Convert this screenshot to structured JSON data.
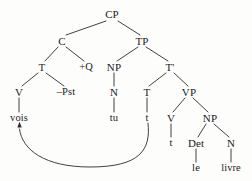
{
  "diagram": {
    "type": "constituency-tree",
    "language_example": "vois tu le livre",
    "canvas": {
      "width": 252,
      "height": 181,
      "background": "#fdfdfc"
    },
    "line_color": "#2b2b2b",
    "text_color": "#1a1a1a"
  },
  "nodes": {
    "cp": {
      "label": "CP",
      "x": 112,
      "y": 14,
      "kind": "category"
    },
    "c": {
      "label": "C",
      "x": 62,
      "y": 41,
      "kind": "category"
    },
    "tp": {
      "label": "TP",
      "x": 142,
      "y": 41,
      "kind": "category"
    },
    "t_in_c": {
      "label": "T",
      "x": 42,
      "y": 67,
      "kind": "category"
    },
    "q_feature": {
      "label": "+Q",
      "x": 86,
      "y": 67,
      "kind": "feature"
    },
    "np_subj": {
      "label": "NP",
      "x": 114,
      "y": 67,
      "kind": "category"
    },
    "tbar": {
      "label": "T'",
      "x": 170,
      "y": 67,
      "kind": "category"
    },
    "v_in_t": {
      "label": "V",
      "x": 19,
      "y": 92,
      "kind": "category"
    },
    "pst": {
      "label": "–Pst",
      "x": 66,
      "y": 92,
      "kind": "feature"
    },
    "n_subj": {
      "label": "N",
      "x": 114,
      "y": 92,
      "kind": "category"
    },
    "t_head": {
      "label": "T",
      "x": 147,
      "y": 92,
      "kind": "category"
    },
    "vp": {
      "label": "VP",
      "x": 189,
      "y": 92,
      "kind": "category"
    },
    "vois": {
      "label": "vois",
      "x": 19,
      "y": 118,
      "kind": "word"
    },
    "tu": {
      "label": "tu",
      "x": 114,
      "y": 118,
      "kind": "word"
    },
    "t_trace": {
      "label": "t",
      "x": 147,
      "y": 118,
      "kind": "trace"
    },
    "v_head": {
      "label": "V",
      "x": 171,
      "y": 118,
      "kind": "category"
    },
    "np_obj": {
      "label": "NP",
      "x": 210,
      "y": 118,
      "kind": "category"
    },
    "v_trace": {
      "label": "t",
      "x": 171,
      "y": 143,
      "kind": "trace"
    },
    "det": {
      "label": "Det",
      "x": 196,
      "y": 143,
      "kind": "category"
    },
    "n_obj": {
      "label": "N",
      "x": 231,
      "y": 143,
      "kind": "category"
    },
    "le": {
      "label": "le",
      "x": 196,
      "y": 168,
      "kind": "word"
    },
    "livre": {
      "label": "livre",
      "x": 231,
      "y": 168,
      "kind": "word"
    }
  },
  "branches": [
    {
      "name": "cp-to-c",
      "x1": 106,
      "y1": 21,
      "x2": 66,
      "y2": 35
    },
    {
      "name": "cp-to-tp",
      "x1": 118,
      "y1": 21,
      "x2": 140,
      "y2": 35
    },
    {
      "name": "c-to-t",
      "x1": 58,
      "y1": 47,
      "x2": 45,
      "y2": 61
    },
    {
      "name": "c-to-plusq",
      "x1": 66,
      "y1": 47,
      "x2": 84,
      "y2": 61
    },
    {
      "name": "tp-to-np",
      "x1": 138,
      "y1": 47,
      "x2": 117,
      "y2": 61
    },
    {
      "name": "tp-to-tbar",
      "x1": 146,
      "y1": 47,
      "x2": 168,
      "y2": 61
    },
    {
      "name": "t-to-v",
      "x1": 38,
      "y1": 73,
      "x2": 22,
      "y2": 86
    },
    {
      "name": "t-to-pst",
      "x1": 46,
      "y1": 73,
      "x2": 64,
      "y2": 86
    },
    {
      "name": "np-to-n",
      "x1": 114,
      "y1": 73,
      "x2": 114,
      "y2": 86
    },
    {
      "name": "tbar-to-t",
      "x1": 166,
      "y1": 73,
      "x2": 149,
      "y2": 86
    },
    {
      "name": "tbar-to-vp",
      "x1": 174,
      "y1": 73,
      "x2": 188,
      "y2": 86
    },
    {
      "name": "v-to-vois",
      "x1": 19,
      "y1": 98,
      "x2": 19,
      "y2": 112
    },
    {
      "name": "n-to-tu",
      "x1": 114,
      "y1": 98,
      "x2": 114,
      "y2": 112
    },
    {
      "name": "t-to-trace",
      "x1": 147,
      "y1": 98,
      "x2": 147,
      "y2": 112
    },
    {
      "name": "vp-to-v",
      "x1": 185,
      "y1": 98,
      "x2": 173,
      "y2": 112
    },
    {
      "name": "vp-to-np",
      "x1": 193,
      "y1": 98,
      "x2": 208,
      "y2": 112
    },
    {
      "name": "v-to-vtrace",
      "x1": 171,
      "y1": 124,
      "x2": 171,
      "y2": 137
    },
    {
      "name": "npobj-to-det",
      "x1": 206,
      "y1": 124,
      "x2": 198,
      "y2": 137
    },
    {
      "name": "npobj-to-n",
      "x1": 214,
      "y1": 124,
      "x2": 229,
      "y2": 137
    },
    {
      "name": "det-to-le",
      "x1": 196,
      "y1": 149,
      "x2": 196,
      "y2": 162
    },
    {
      "name": "n-to-livre",
      "x1": 231,
      "y1": 149,
      "x2": 231,
      "y2": 162
    }
  ],
  "movement_arrow": {
    "name": "head-movement-t-to-c",
    "from_node": "t_trace",
    "to_node": "vois",
    "path": "M 148 123 C 151 150, 140 167, 90 167 C 45 167, 22 150, 19.5 129",
    "arrowhead": {
      "x": 19.5,
      "y": 125,
      "direction": "up"
    }
  }
}
